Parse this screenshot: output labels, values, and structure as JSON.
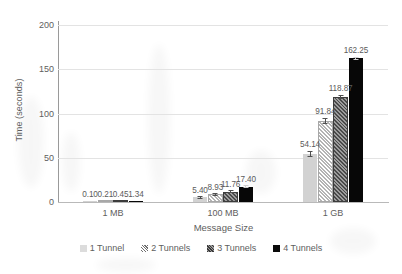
{
  "chart_data": {
    "type": "bar",
    "title": "",
    "xlabel": "Message Size",
    "ylabel": "Time (seconds)",
    "categories": [
      "1 MB",
      "100 MB",
      "1 GB"
    ],
    "ylim": [
      0,
      200
    ],
    "yticks": [
      0,
      50,
      100,
      150,
      200
    ],
    "ytick_labels": [
      "0",
      "50",
      "100",
      "150",
      "200"
    ],
    "grid": "horizontal",
    "legend_position": "bottom",
    "series": [
      {
        "name": "1 Tunnel",
        "fill": "solid-light",
        "color": "#d2d2d2",
        "values": [
          0.1,
          5.4,
          54.14
        ],
        "labels": [
          "0.10",
          "5.40",
          "54.14"
        ],
        "errors": [
          0.0,
          0.3,
          3.2
        ]
      },
      {
        "name": "2 Tunnels",
        "fill": "hatch-light",
        "color": "#b4b4b4",
        "values": [
          0.21,
          8.93,
          91.84
        ],
        "labels": [
          "0.21",
          "8.93",
          "91.84"
        ],
        "errors": [
          0.0,
          0.4,
          3.6
        ]
      },
      {
        "name": "3 Tunnels",
        "fill": "hatch-dark",
        "color": "#4a4a4a",
        "values": [
          0.45,
          11.76,
          118.87
        ],
        "labels": [
          "0.45",
          "11.76",
          "118.87"
        ],
        "errors": [
          0.0,
          0.4,
          2.0
        ]
      },
      {
        "name": "4 Tunnels",
        "fill": "solid-black",
        "color": "#070707",
        "values": [
          1.34,
          17.4,
          162.25
        ],
        "labels": [
          "1.34",
          "17.40",
          "162.25"
        ],
        "errors": [
          0.0,
          0.4,
          1.6
        ]
      }
    ]
  },
  "axes": {
    "y_title": "Time (seconds)",
    "x_title": "Message Size"
  },
  "legend": {
    "items": [
      {
        "label": "1 Tunnel"
      },
      {
        "label": "2 Tunnels"
      },
      {
        "label": "3 Tunnels"
      },
      {
        "label": "4 Tunnels"
      }
    ]
  }
}
